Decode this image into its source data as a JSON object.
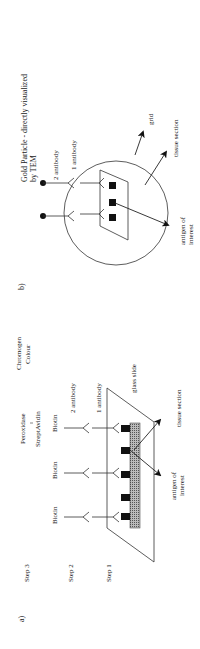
{
  "panel_a": {
    "label": "a)",
    "steps": [
      "Step 3",
      "Step 2",
      "Step 1"
    ],
    "biotin_1": "Biotin",
    "biotin_2": "Biotin",
    "biotin_3": "Biotin",
    "peroxidase": "Peroxidase",
    "streptavidin": "StreptAvidin",
    "chromogen": "Chromogen",
    "colour": "Colour",
    "antibody_2": "2  antibody",
    "antibody_1": "1  antibody",
    "glass_slide": "glass slide",
    "tissue_section": "tissue section",
    "antigen_line1": "antigen of",
    "antigen_line2": "interest"
  },
  "panel_b": {
    "label": "b)",
    "title_line1": "Gold Particle - directly visualized",
    "title_line2": "by TEM",
    "antibody_2": "2 antibody",
    "antibody_1": "1 antibody",
    "grid": "grid",
    "tissue_section": "tissue section",
    "antigen_line1": "antigen of",
    "antigen_line2": "interest"
  }
}
